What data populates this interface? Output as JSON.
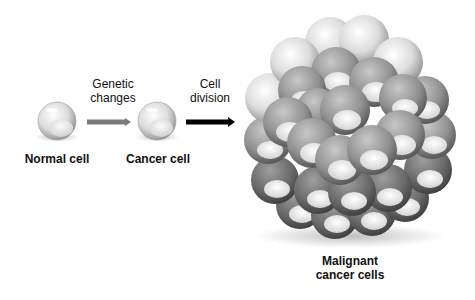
{
  "diagram": {
    "stages": [
      {
        "id": "normal",
        "label": "Normal cell"
      },
      {
        "id": "cancer",
        "label": "Cancer cell"
      },
      {
        "id": "malignant",
        "label_line1": "Malignant",
        "label_line2": "cancer cells"
      }
    ],
    "transitions": [
      {
        "from": "normal",
        "to": "cancer",
        "label_line1": "Genetic",
        "label_line2": "changes",
        "arrow_color": "#7a7a7a"
      },
      {
        "from": "cancer",
        "to": "malignant",
        "label_line1": "Cell",
        "label_line2": "division",
        "arrow_color": "#000000"
      }
    ]
  },
  "colors": {
    "background": "#ffffff",
    "cell_light": "#e8e8e8",
    "cell_mid": "#9a9a9a",
    "cell_dark": "#5e5e5e",
    "text": "#111111"
  }
}
